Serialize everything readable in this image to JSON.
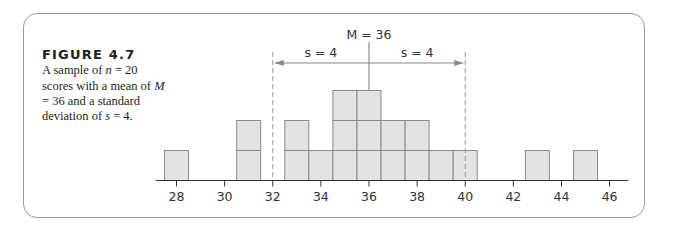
{
  "figure": {
    "label": "FIGURE 4.7",
    "caption_parts": [
      "A sample of ",
      "n",
      " = 20 scores with a mean of ",
      "M",
      " = 36 and a standard deviation of ",
      "s",
      " = 4."
    ]
  },
  "colors": {
    "bar_fill": "#e3e3e3",
    "bar_stroke": "#8c8c8c",
    "axis": "#333333",
    "frame": "#9a9a9a",
    "dashed": "#999999"
  },
  "chart_data": {
    "type": "bar",
    "subtype": "histogram (stacked unit boxes)",
    "title": "",
    "xlabel": "",
    "ylabel": "",
    "x": [
      28,
      31,
      33,
      34,
      35,
      36,
      37,
      38,
      39,
      40,
      43,
      45
    ],
    "values": [
      1,
      2,
      2,
      1,
      3,
      3,
      2,
      2,
      1,
      1,
      1,
      1
    ],
    "n": 20,
    "xlim": [
      27.3,
      46.7
    ],
    "xticks": [
      28,
      30,
      32,
      34,
      36,
      38,
      40,
      42,
      44,
      46
    ],
    "grid": false,
    "annotations": {
      "mean_label": "M = 36",
      "mean_value": 36,
      "sd_left_label": "s = 4",
      "sd_right_label": "s = 4",
      "sd_value": 4,
      "dashed_lines_at": [
        32,
        40
      ]
    }
  }
}
